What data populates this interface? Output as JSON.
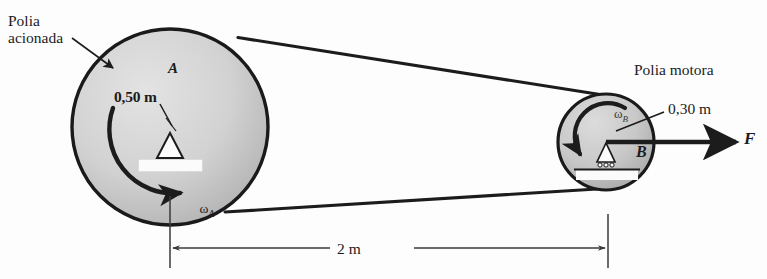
{
  "figure": {
    "title_alt": "Sistema de polias acionadas por correia",
    "background_color": "#fdfdfd",
    "ink_color": "#1c1c1c",
    "pulley_fill_light": "#d9d9d9",
    "pulley_fill_dark": "#b4b4b4"
  },
  "labels": {
    "driven_pulley": "Polia\nacionada",
    "driver_pulley": "Polia motora",
    "radius_a": "0,50 m",
    "radius_b": "0,30 m",
    "point_a": "A",
    "point_b": "B",
    "force": "F",
    "omega_a": "ω",
    "omega_a_sub": "A",
    "omega_b": "ω",
    "omega_b_sub": "B",
    "distance": "2 m"
  },
  "geometry": {
    "pulley_a": {
      "cx": 170,
      "cy": 127,
      "r": 98,
      "radius_m": 0.5,
      "name": "A"
    },
    "pulley_b": {
      "cx": 606,
      "cy": 142,
      "r": 48,
      "radius_m": 0.3,
      "name": "B"
    },
    "center_distance_m": 2,
    "dimension_line": {
      "x_left": 170,
      "x_right": 608,
      "y": 248
    }
  },
  "icons": {
    "leader_arrow_driven": "arrow-leader-icon",
    "leader_arrow_radius_a": "arrow-leader-icon",
    "leader_arrow_radius_b": "arrow-leader-icon",
    "rotation_arrow_a": "curved-arrow-icon",
    "rotation_arrow_b": "curved-arrow-icon",
    "force_arrow": "arrow-right-icon",
    "dimension_arrows": "double-arrow-icon",
    "pivot_support_a": "pin-support-icon",
    "pivot_support_b": "roller-support-icon"
  }
}
